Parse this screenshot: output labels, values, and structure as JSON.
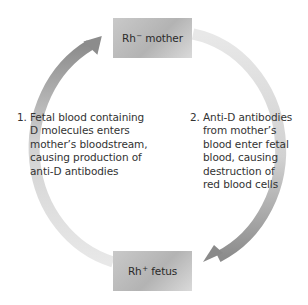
{
  "nodes": {
    "top": {
      "label": "Rh",
      "sign": "−",
      "suffix": "mother"
    },
    "bottom": {
      "label": "Rh",
      "sign": "+",
      "suffix": "fetus"
    }
  },
  "steps": [
    {
      "number": "1.",
      "lines": [
        "Fetal blood containing",
        "D molecules enters",
        "mother’s bloodstream,",
        "causing production of",
        "anti-D antibodies"
      ]
    },
    {
      "number": "2.",
      "lines": [
        "Anti-D antibodies",
        "from mother’s",
        "blood enter fetal",
        "blood, causing",
        "destruction of",
        "red blood cells"
      ]
    }
  ],
  "colors": {
    "arc_light": "#e6e6e6",
    "arc_dark": "#8a8a8a",
    "box": "#bdbdbd"
  }
}
